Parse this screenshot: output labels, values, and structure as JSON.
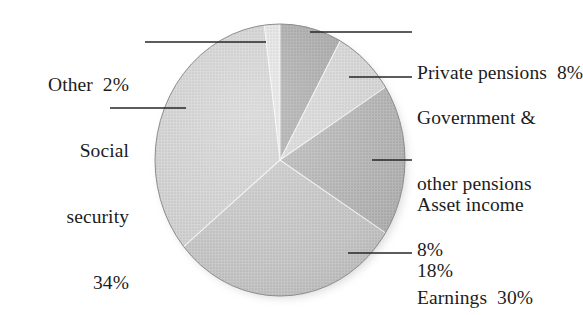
{
  "chart_data": {
    "type": "pie",
    "title": "",
    "subtitle": "",
    "xlabel": "",
    "ylabel": "",
    "legend_position": "none",
    "grid": false,
    "units": "percent",
    "total": 100,
    "categories": [
      "Private pensions",
      "Government & other pensions",
      "Asset income",
      "Earnings",
      "Social security",
      "Other"
    ],
    "values": [
      8,
      8,
      18,
      30,
      34,
      2
    ],
    "labels": [
      "Private pensions  8%",
      "Government & other pensions 8%",
      "Asset income 18%",
      "Earnings  30%",
      "Social security 34%",
      "Other  2%"
    ],
    "colors": [
      "#9a9a9a",
      "#cfcfcf",
      "#a8a8a8",
      "#b9b9b9",
      "#c6c6c6",
      "#dcdcdc"
    ],
    "start_angle_deg": 0,
    "direction": "clockwise",
    "slices": [
      {
        "name": "Private pensions",
        "value": 8,
        "color": "#9a9a9a"
      },
      {
        "name": "Government & other pensions",
        "value": 8,
        "color": "#cfcfcf"
      },
      {
        "name": "Asset income",
        "value": 18,
        "color": "#a8a8a8"
      },
      {
        "name": "Earnings",
        "value": 30,
        "color": "#bdbdbd"
      },
      {
        "name": "Social security",
        "value": 34,
        "color": "#c9c9c9"
      },
      {
        "name": "Other",
        "value": 2,
        "color": "#dedede"
      }
    ]
  },
  "labels": {
    "private_pensions": "Private pensions  8%",
    "government_line1": "Government &",
    "government_line2": "other pensions",
    "government_line3": "8%",
    "asset_line1": "Asset income",
    "asset_line2": "18%",
    "earnings": "Earnings  30%",
    "other": "Other  2%",
    "social_line1": "Social",
    "social_line2": "security",
    "social_line3": "34%"
  },
  "colors": {
    "background": "#ffffff",
    "text": "#1c1c1c",
    "leader_line": "#2a2a2a",
    "pie_edge": "#8e8e8e"
  }
}
